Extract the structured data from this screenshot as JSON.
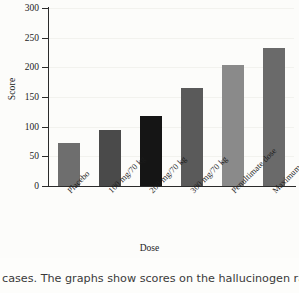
{
  "chart_data": {
    "type": "bar",
    "title": "",
    "xlabel": "Dose",
    "ylabel": "Score",
    "categories": [
      "Placebo",
      "100 mg/70 kg",
      "200 mg/70 kg",
      "300 mg/70 kg",
      "Penultimate dose",
      "Maximum dose"
    ],
    "values": [
      72,
      95,
      118,
      165,
      204,
      233
    ],
    "bar_colors": [
      "#6e6e6e",
      "#4a4a4a",
      "#151515",
      "#5a5a5a",
      "#8a8a8a",
      "#6a6a6a"
    ],
    "ylim": [
      0,
      300
    ],
    "yticks": [
      0,
      50,
      100,
      150,
      200,
      250,
      300
    ],
    "ytick_labels": [
      "0",
      "50",
      "100",
      "150",
      "200",
      "250",
      "300"
    ],
    "grid": true,
    "legend": "none",
    "xtick_label_rotation": -45
  },
  "caption": {
    "text": "cases. The graphs show scores on the hallucinogen rating"
  },
  "colors": {
    "axis": "#2a2a2a",
    "text": "#1b1b1b",
    "background": "#fcfcfa",
    "gridline": "#f2f2ee"
  }
}
